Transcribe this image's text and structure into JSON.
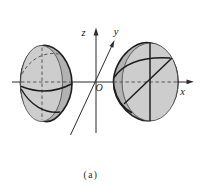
{
  "figure": {
    "caption": "(a)",
    "axes": {
      "x_label": "x",
      "y_label": "y",
      "z_label": "z",
      "origin_label": "O"
    },
    "shapes": {
      "left": "left-hemisphere",
      "right": "right-hemisphere"
    },
    "colors": {
      "background": "#ffffff",
      "dome_fill": "#b2b2b2",
      "face_fill": "#cdcdcd",
      "line": "#1c1c1c",
      "axis": "#2b2b2b",
      "dashed": "#4f4f4f",
      "text": "#1a1a1a"
    }
  }
}
